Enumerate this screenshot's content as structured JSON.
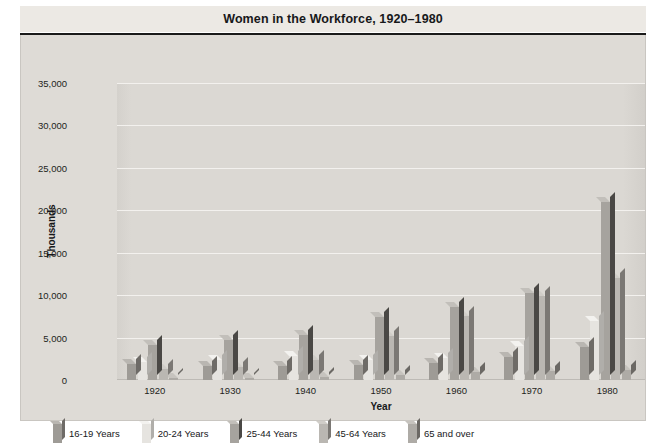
{
  "chart_data": {
    "type": "bar",
    "title": "Women in the Workforce, 1920–1980",
    "xlabel": "Year",
    "ylabel": "Thousands",
    "categories": [
      "1920",
      "1930",
      "1940",
      "1950",
      "1960",
      "1970",
      "1980"
    ],
    "ylim": [
      0,
      35000
    ],
    "yticks": [
      0,
      5000,
      10000,
      15000,
      20000,
      25000,
      30000,
      35000
    ],
    "ytick_labels": [
      "0",
      "5,000",
      "10,000",
      "15,000",
      "20,000",
      "25,000",
      "30,000",
      "35,000"
    ],
    "grid": true,
    "legend_position": "bottom",
    "series": [
      {
        "name": "16-19 Years",
        "color": "#9e9b96",
        "side_color": "#6e6b67",
        "top_color": "#b9b6b1",
        "values": [
          1900,
          1700,
          1700,
          1800,
          2000,
          2700,
          3900
        ]
      },
      {
        "name": "20-24 Years",
        "color": "#e6e4e0",
        "side_color": "#b0aeaa",
        "top_color": "#f3f2ef",
        "values": [
          2100,
          2400,
          2800,
          2400,
          2600,
          4000,
          7000
        ]
      },
      {
        "name": "25-44 Years",
        "color": "#a6a39e",
        "side_color": "#4a4845",
        "top_color": "#c2bfba",
        "values": [
          4100,
          4700,
          5300,
          7400,
          8600,
          10200,
          21000
        ]
      },
      {
        "name": "45-64 Years",
        "color": "#bab7b2",
        "side_color": "#7b7874",
        "top_color": "#d0cdc8",
        "values": [
          1300,
          1500,
          2400,
          5200,
          7500,
          9900,
          12000
        ]
      },
      {
        "name": "65 and over",
        "color": "#aeaba6",
        "side_color": "#6b6864",
        "top_color": "#c6c3be",
        "values": [
          150,
          200,
          300,
          600,
          1000,
          1100,
          1200
        ]
      }
    ]
  }
}
